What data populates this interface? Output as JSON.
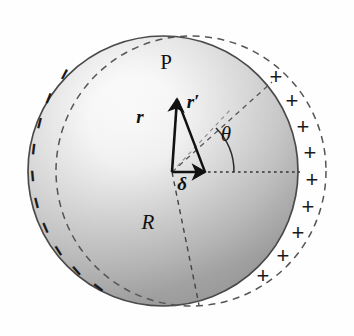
{
  "figure": {
    "background_color": "#fefefe"
  },
  "colors": {
    "outline": "#4a4a4a",
    "dashed": "#555555",
    "ink": "#111111",
    "shade_light": "#fdfdfd",
    "shade_mid": "#c9c9c9",
    "shade_dark": "#8e8e8e"
  },
  "geometry": {
    "negative_sphere": {
      "cx": 163,
      "cy": 171,
      "r": 135,
      "style": "solid"
    },
    "positive_sphere": {
      "cx": 191,
      "cy": 171,
      "r": 135,
      "style": "dashed"
    },
    "origin": {
      "x": 172,
      "y": 172
    },
    "point_P": {
      "x": 177,
      "y": 98
    },
    "delta_tip": {
      "x": 205,
      "y": 172
    },
    "theta_degrees": 42
  },
  "labels": {
    "point": "P",
    "vector_r": "r",
    "vector_r_prime": "r′",
    "vector_delta": "δ",
    "angle_theta": "θ",
    "radius_R": "R"
  },
  "charges": {
    "negative_symbol": "−",
    "positive_symbol": "+",
    "negative_count": 10,
    "positive_count": 9,
    "negative_positions": [
      {
        "x": 64,
        "y": 74,
        "rot": -62
      },
      {
        "x": 48,
        "y": 98,
        "rot": -68
      },
      {
        "x": 39,
        "y": 123,
        "rot": -76
      },
      {
        "x": 33,
        "y": 149,
        "rot": -83
      },
      {
        "x": 32,
        "y": 176,
        "rot": -95
      },
      {
        "x": 36,
        "y": 203,
        "rot": -104
      },
      {
        "x": 45,
        "y": 228,
        "rot": -113
      },
      {
        "x": 58,
        "y": 251,
        "rot": -122
      },
      {
        "x": 76,
        "y": 271,
        "rot": -131
      },
      {
        "x": 98,
        "y": 288,
        "rot": -142
      }
    ],
    "positive_positions": [
      {
        "x": 276,
        "y": 77
      },
      {
        "x": 292,
        "y": 101
      },
      {
        "x": 303,
        "y": 127
      },
      {
        "x": 310,
        "y": 153
      },
      {
        "x": 312,
        "y": 180
      },
      {
        "x": 308,
        "y": 207
      },
      {
        "x": 298,
        "y": 233
      },
      {
        "x": 283,
        "y": 256
      },
      {
        "x": 263,
        "y": 276
      }
    ]
  },
  "label_positions": {
    "point": {
      "x": 166,
      "y": 62
    },
    "vector_r": {
      "x": 140,
      "y": 116
    },
    "vector_r_prime": {
      "x": 193,
      "y": 101
    },
    "vector_delta": {
      "x": 182,
      "y": 183
    },
    "angle_theta": {
      "x": 226,
      "y": 134
    },
    "radius_R": {
      "x": 148,
      "y": 222
    }
  }
}
